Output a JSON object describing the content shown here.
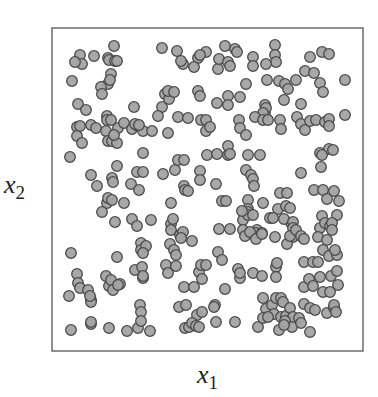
{
  "chart_data": {
    "type": "scatter",
    "title": "",
    "xlabel": "x1",
    "ylabel": "x2",
    "xlabel_parts": {
      "base": "x",
      "sub": "1"
    },
    "ylabel_parts": {
      "base": "x",
      "sub": "2"
    },
    "ticks": "none",
    "grid": false,
    "legend": "none",
    "frame": {
      "left": 52,
      "top": 28,
      "right": 363,
      "bottom": 351,
      "stroke": "#555555"
    },
    "marker": {
      "shape": "circle",
      "radius": 5.3,
      "fill": "#a3a3a3",
      "stroke": "#4a4a4a",
      "stroke_width": 1.3
    },
    "note": "Points given in pixel coordinates (x right, y down) within a 378x397 canvas; ~300 uniformly scattered points",
    "points": [
      [
        114,
        46
      ],
      [
        162,
        48
      ],
      [
        177,
        51
      ],
      [
        183,
        64
      ],
      [
        198,
        58
      ],
      [
        206,
        52
      ],
      [
        225,
        46
      ],
      [
        235,
        49
      ],
      [
        237,
        52
      ],
      [
        275,
        45
      ],
      [
        275,
        55
      ],
      [
        276,
        62
      ],
      [
        310,
        57
      ],
      [
        322,
        52
      ],
      [
        329,
        54
      ],
      [
        80,
        55
      ],
      [
        82,
        64
      ],
      [
        75,
        62
      ],
      [
        94,
        56
      ],
      [
        108,
        58
      ],
      [
        109,
        60
      ],
      [
        115,
        61
      ],
      [
        117,
        61
      ],
      [
        181,
        61
      ],
      [
        194,
        67
      ],
      [
        200,
        55
      ],
      [
        218,
        69
      ],
      [
        219,
        59
      ],
      [
        228,
        62
      ],
      [
        230,
        66
      ],
      [
        253,
        57
      ],
      [
        253,
        66
      ],
      [
        266,
        64
      ],
      [
        72,
        81
      ],
      [
        111,
        74
      ],
      [
        108,
        84
      ],
      [
        101,
        87
      ],
      [
        102,
        94
      ],
      [
        110,
        80
      ],
      [
        246,
        84
      ],
      [
        267,
        80
      ],
      [
        279,
        81
      ],
      [
        285,
        84
      ],
      [
        288,
        89
      ],
      [
        284,
        100
      ],
      [
        296,
        80
      ],
      [
        305,
        71
      ],
      [
        314,
        73
      ],
      [
        320,
        83
      ],
      [
        323,
        92
      ],
      [
        345,
        80
      ],
      [
        78,
        104
      ],
      [
        86,
        110
      ],
      [
        107,
        116
      ],
      [
        134,
        107
      ],
      [
        162,
        107
      ],
      [
        165,
        94
      ],
      [
        169,
        99
      ],
      [
        168,
        91
      ],
      [
        174,
        92
      ],
      [
        198,
        91
      ],
      [
        200,
        96
      ],
      [
        217,
        103
      ],
      [
        228,
        96
      ],
      [
        228,
        105
      ],
      [
        240,
        97
      ],
      [
        265,
        105
      ],
      [
        265,
        113
      ],
      [
        266,
        108
      ],
      [
        263,
        113
      ],
      [
        301,
        104
      ],
      [
        107,
        120
      ],
      [
        77,
        127
      ],
      [
        80,
        126
      ],
      [
        91,
        125
      ],
      [
        96,
        128
      ],
      [
        106,
        131
      ],
      [
        118,
        128
      ],
      [
        124,
        123
      ],
      [
        111,
        120
      ],
      [
        132,
        129
      ],
      [
        138,
        126
      ],
      [
        143,
        131
      ],
      [
        152,
        131
      ],
      [
        135,
        124
      ],
      [
        139,
        125
      ],
      [
        77,
        136
      ],
      [
        82,
        143
      ],
      [
        108,
        141
      ],
      [
        112,
        141
      ],
      [
        117,
        143
      ],
      [
        114,
        135
      ],
      [
        158,
        116
      ],
      [
        168,
        133
      ],
      [
        178,
        117
      ],
      [
        188,
        118
      ],
      [
        201,
        120
      ],
      [
        206,
        120
      ],
      [
        206,
        131
      ],
      [
        210,
        127
      ],
      [
        239,
        120
      ],
      [
        240,
        128
      ],
      [
        246,
        135
      ],
      [
        255,
        117
      ],
      [
        263,
        120
      ],
      [
        268,
        120
      ],
      [
        280,
        120
      ],
      [
        281,
        129
      ],
      [
        297,
        117
      ],
      [
        301,
        124
      ],
      [
        305,
        130
      ],
      [
        310,
        121
      ],
      [
        316,
        120
      ],
      [
        325,
        122
      ],
      [
        329,
        119
      ],
      [
        329,
        126
      ],
      [
        345,
        115
      ],
      [
        70,
        157
      ],
      [
        143,
        153
      ],
      [
        207,
        155
      ],
      [
        217,
        154
      ],
      [
        228,
        155
      ],
      [
        228,
        146
      ],
      [
        230,
        154
      ],
      [
        248,
        155
      ],
      [
        260,
        155
      ],
      [
        320,
        153
      ],
      [
        329,
        149
      ],
      [
        333,
        150
      ],
      [
        91,
        175
      ],
      [
        97,
        186
      ],
      [
        112,
        178
      ],
      [
        113,
        182
      ],
      [
        117,
        166
      ],
      [
        131,
        184
      ],
      [
        139,
        190
      ],
      [
        137,
        172
      ],
      [
        143,
        172
      ],
      [
        163,
        174
      ],
      [
        175,
        170
      ],
      [
        178,
        160
      ],
      [
        184,
        160
      ],
      [
        200,
        171
      ],
      [
        200,
        180
      ],
      [
        184,
        186
      ],
      [
        216,
        184
      ],
      [
        246,
        170
      ],
      [
        251,
        175
      ],
      [
        253,
        179
      ],
      [
        254,
        186
      ],
      [
        301,
        173
      ],
      [
        321,
        167
      ],
      [
        322,
        155
      ],
      [
        314,
        190
      ],
      [
        323,
        190
      ],
      [
        334,
        191
      ],
      [
        327,
        199
      ],
      [
        339,
        201
      ],
      [
        280,
        193
      ],
      [
        287,
        193
      ],
      [
        185,
        190
      ],
      [
        188,
        191
      ],
      [
        107,
        203
      ],
      [
        108,
        198
      ],
      [
        112,
        200
      ],
      [
        102,
        212
      ],
      [
        124,
        203
      ],
      [
        171,
        203
      ],
      [
        222,
        201
      ],
      [
        226,
        201
      ],
      [
        248,
        200
      ],
      [
        263,
        203
      ],
      [
        248,
        209
      ],
      [
        248,
        212
      ],
      [
        278,
        209
      ],
      [
        286,
        206
      ],
      [
        290,
        208
      ],
      [
        291,
        223
      ],
      [
        115,
        222
      ],
      [
        132,
        219
      ],
      [
        137,
        226
      ],
      [
        151,
        220
      ],
      [
        171,
        224
      ],
      [
        173,
        219
      ],
      [
        171,
        230
      ],
      [
        180,
        235
      ],
      [
        183,
        232
      ],
      [
        181,
        238
      ],
      [
        219,
        229
      ],
      [
        230,
        229
      ],
      [
        243,
        220
      ],
      [
        243,
        230
      ],
      [
        248,
        215
      ],
      [
        242,
        211
      ],
      [
        253,
        215
      ],
      [
        257,
        230
      ],
      [
        256,
        233
      ],
      [
        262,
        233
      ],
      [
        270,
        218
      ],
      [
        273,
        218
      ],
      [
        284,
        219
      ],
      [
        293,
        222
      ],
      [
        293,
        228
      ],
      [
        293,
        237
      ],
      [
        322,
        216
      ],
      [
        320,
        228
      ],
      [
        325,
        223
      ],
      [
        337,
        215
      ],
      [
        330,
        226
      ],
      [
        332,
        223
      ],
      [
        332,
        230
      ],
      [
        71,
        253
      ],
      [
        117,
        257
      ],
      [
        141,
        243
      ],
      [
        141,
        250
      ],
      [
        146,
        246
      ],
      [
        143,
        253
      ],
      [
        170,
        244
      ],
      [
        174,
        250
      ],
      [
        176,
        255
      ],
      [
        192,
        241
      ],
      [
        218,
        252
      ],
      [
        245,
        236
      ],
      [
        250,
        232
      ],
      [
        256,
        239
      ],
      [
        262,
        234
      ],
      [
        275,
        237
      ],
      [
        287,
        244
      ],
      [
        290,
        236
      ],
      [
        296,
        230
      ],
      [
        301,
        236
      ],
      [
        304,
        239
      ],
      [
        318,
        237
      ],
      [
        327,
        240
      ],
      [
        323,
        250
      ],
      [
        329,
        256
      ],
      [
        337,
        255
      ],
      [
        335,
        250
      ],
      [
        77,
        274
      ],
      [
        78,
        283
      ],
      [
        80,
        288
      ],
      [
        69,
        296
      ],
      [
        88,
        290
      ],
      [
        91,
        300
      ],
      [
        106,
        276
      ],
      [
        109,
        286
      ],
      [
        135,
        270
      ],
      [
        142,
        267
      ],
      [
        143,
        278
      ],
      [
        120,
        284
      ],
      [
        111,
        280
      ],
      [
        113,
        290
      ],
      [
        118,
        285
      ],
      [
        143,
        276
      ],
      [
        166,
        265
      ],
      [
        168,
        273
      ],
      [
        176,
        266
      ],
      [
        184,
        287
      ],
      [
        199,
        272
      ],
      [
        202,
        279
      ],
      [
        201,
        265
      ],
      [
        194,
        287
      ],
      [
        206,
        265
      ],
      [
        222,
        260
      ],
      [
        238,
        269
      ],
      [
        240,
        278
      ],
      [
        240,
        273
      ],
      [
        253,
        273
      ],
      [
        262,
        276
      ],
      [
        276,
        267
      ],
      [
        277,
        263
      ],
      [
        276,
        277
      ],
      [
        304,
        262
      ],
      [
        313,
        262
      ],
      [
        318,
        262
      ],
      [
        320,
        277
      ],
      [
        331,
        276
      ],
      [
        337,
        271
      ],
      [
        338,
        285
      ],
      [
        304,
        287
      ],
      [
        309,
        279
      ],
      [
        313,
        286
      ],
      [
        323,
        292
      ],
      [
        330,
        292
      ],
      [
        91,
        302
      ],
      [
        90,
        296
      ],
      [
        140,
        305
      ],
      [
        141,
        312
      ],
      [
        179,
        307
      ],
      [
        186,
        305
      ],
      [
        197,
        315
      ],
      [
        202,
        312
      ],
      [
        215,
        305
      ],
      [
        214,
        307
      ],
      [
        225,
        289
      ],
      [
        235,
        322
      ],
      [
        263,
        298
      ],
      [
        266,
        309
      ],
      [
        272,
        305
      ],
      [
        276,
        298
      ],
      [
        281,
        298
      ],
      [
        274,
        314
      ],
      [
        281,
        317
      ],
      [
        286,
        316
      ],
      [
        283,
        302
      ],
      [
        290,
        308
      ],
      [
        293,
        317
      ],
      [
        292,
        327
      ],
      [
        304,
        304
      ],
      [
        310,
        308
      ],
      [
        315,
        310
      ],
      [
        327,
        313
      ],
      [
        334,
        308
      ],
      [
        334,
        305
      ],
      [
        336,
        312
      ],
      [
        71,
        330
      ],
      [
        91,
        324
      ],
      [
        91,
        322
      ],
      [
        109,
        328
      ],
      [
        127,
        331
      ],
      [
        138,
        328
      ],
      [
        141,
        321
      ],
      [
        150,
        331
      ],
      [
        185,
        328
      ],
      [
        189,
        327
      ],
      [
        192,
        323
      ],
      [
        196,
        326
      ],
      [
        199,
        327
      ],
      [
        216,
        322
      ],
      [
        258,
        327
      ],
      [
        263,
        318
      ],
      [
        268,
        317
      ],
      [
        279,
        330
      ],
      [
        285,
        321
      ],
      [
        284,
        325
      ],
      [
        310,
        332
      ],
      [
        299,
        318
      ],
      [
        301,
        323
      ]
    ]
  }
}
